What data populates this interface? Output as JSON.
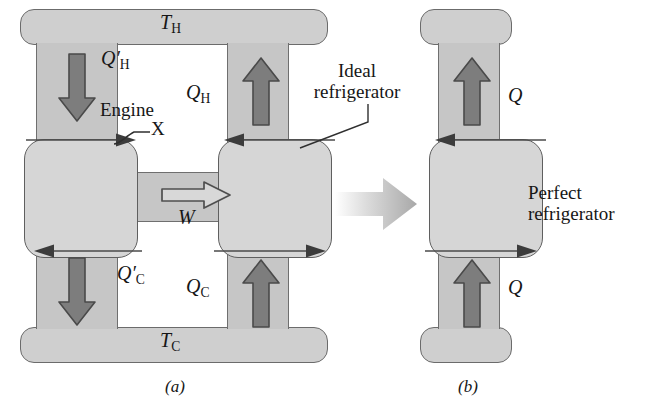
{
  "figure": {
    "caption_a": "(a)",
    "caption_b": "(b)"
  },
  "panel_a": {
    "hot_reservoir_label": "T",
    "hot_reservoir_sub": "H",
    "cold_reservoir_label": "T",
    "cold_reservoir_sub": "C",
    "engine_label": "Engine",
    "engine_name": "X",
    "engine_leader": "–X",
    "work_label": "W",
    "q_h_prime": "Q",
    "q_h_prime_mark": "′",
    "q_h_prime_sub": "H",
    "q_h": "Q",
    "q_h_sub": "H",
    "q_c_prime": "Q",
    "q_c_prime_mark": "′",
    "q_c_prime_sub": "C",
    "q_c": "Q",
    "q_c_sub": "C",
    "ideal_refrigerator_line1": "Ideal",
    "ideal_refrigerator_line2": "refrigerator",
    "arrow_down_left_icon": "arrow-down-icon",
    "arrow_up_right_icon": "arrow-up-icon",
    "arrow_work_icon": "hollow-arrow-right-icon",
    "flow_arrow_icons": [
      "flow-arrow-right-icon",
      "flow-arrow-left-icon",
      "flow-arrow-left-icon",
      "flow-arrow-right-icon"
    ]
  },
  "transition": {
    "icon": "equivalence-arrow-icon",
    "direction": "right"
  },
  "panel_b": {
    "perfect_refrigerator_line1": "Perfect",
    "perfect_refrigerator_line2": "refrigerator",
    "q_top": "Q",
    "q_bottom": "Q",
    "arrow_up_top_icon": "arrow-up-icon",
    "arrow_up_bottom_icon": "arrow-up-icon",
    "flow_arrow_top_icon": "flow-arrow-left-icon",
    "flow_arrow_bottom_icon": "flow-arrow-right-icon"
  },
  "colors": {
    "reservoir_fill": "#cfcfcf",
    "pipe_fill": "#c6c6c6",
    "device_fill": "#d6d6d6",
    "outline": "#6b6b6b",
    "arrow_fill": "#7a7a7a",
    "arrow_stroke": "#4a4a4a",
    "text": "#161616",
    "background": "#ffffff"
  }
}
